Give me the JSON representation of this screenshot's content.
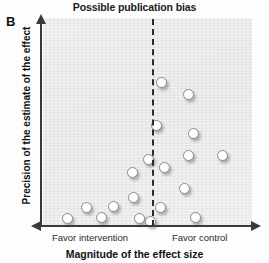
{
  "panel": {
    "letter": "B"
  },
  "title": "Possible publication bias",
  "axes": {
    "x_title": "Magnitude of the effect size",
    "y_title": "Precision of the estimate of the effect",
    "x_left_label": "Favor intervention",
    "x_right_label": "Favor control"
  },
  "colors": {
    "plot_background": "#ececec",
    "axis": "#3a3a3a",
    "reference_line": "#2b2b2b",
    "marker_fill": "#ffffff",
    "marker_stroke": "#8a8a8a",
    "text": "#111111"
  },
  "chart_data": {
    "type": "scatter",
    "title": "Possible publication bias",
    "xlabel": "Magnitude of the effect size",
    "ylabel": "Precision of the estimate of the effect",
    "xlim": [
      0,
      100
    ],
    "ylim": [
      0,
      100
    ],
    "grid": false,
    "legend": null,
    "annotations": [
      {
        "name": "panel-letter",
        "text": "B"
      },
      {
        "name": "x-axis-left-direction",
        "text": "Favor intervention"
      },
      {
        "name": "x-axis-right-direction",
        "text": "Favor control"
      }
    ],
    "reference_line": {
      "orientation": "vertical",
      "x": 52.2,
      "style": "dashed"
    },
    "n_points": 19,
    "points": [
      {
        "x": 56.5,
        "y": 69.2
      },
      {
        "x": 69.4,
        "y": 63.0
      },
      {
        "x": 54.5,
        "y": 48.1
      },
      {
        "x": 72.2,
        "y": 44.7
      },
      {
        "x": 50.7,
        "y": 32.2
      },
      {
        "x": 69.4,
        "y": 34.1
      },
      {
        "x": 86.1,
        "y": 33.7
      },
      {
        "x": 57.9,
        "y": 27.9
      },
      {
        "x": 42.6,
        "y": 25.5
      },
      {
        "x": 67.9,
        "y": 17.8
      },
      {
        "x": 43.1,
        "y": 13.5
      },
      {
        "x": 56.0,
        "y": 9.1
      },
      {
        "x": 20.6,
        "y": 8.7
      },
      {
        "x": 33.5,
        "y": 9.6
      },
      {
        "x": 27.8,
        "y": 4.3
      },
      {
        "x": 11.5,
        "y": 3.4
      },
      {
        "x": 46.4,
        "y": 3.4
      },
      {
        "x": 51.2,
        "y": 2.4
      },
      {
        "x": 73.2,
        "y": 4.3
      }
    ]
  }
}
